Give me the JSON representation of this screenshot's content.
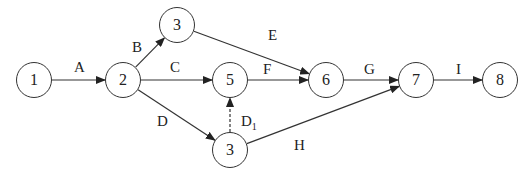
{
  "diagram": {
    "type": "activity-on-arrow network",
    "nodes": [
      {
        "id": "n1",
        "label": "1",
        "x": 34,
        "y": 80
      },
      {
        "id": "n2",
        "label": "2",
        "x": 123,
        "y": 80
      },
      {
        "id": "n3top",
        "label": "3",
        "x": 177,
        "y": 25
      },
      {
        "id": "n5",
        "label": "5",
        "x": 230,
        "y": 80
      },
      {
        "id": "n3bot",
        "label": "3",
        "x": 230,
        "y": 150
      },
      {
        "id": "n6",
        "label": "6",
        "x": 326,
        "y": 80
      },
      {
        "id": "n7",
        "label": "7",
        "x": 416,
        "y": 80
      },
      {
        "id": "n8",
        "label": "8",
        "x": 500,
        "y": 80
      }
    ],
    "edges": [
      {
        "label": "A",
        "from": "n1",
        "to": "n2",
        "dashed": false,
        "lx": 74,
        "ly": 60
      },
      {
        "label": "B",
        "from": "n2",
        "to": "n3top",
        "dashed": false,
        "lx": 132,
        "ly": 40
      },
      {
        "label": "C",
        "from": "n2",
        "to": "n5",
        "dashed": false,
        "lx": 170,
        "ly": 60
      },
      {
        "label": "D",
        "from": "n2",
        "to": "n3bot",
        "dashed": false,
        "lx": 157,
        "ly": 114
      },
      {
        "label": "E",
        "from": "n3top",
        "to": "n6",
        "dashed": false,
        "lx": 268,
        "ly": 28
      },
      {
        "label": "F",
        "from": "n5",
        "to": "n6",
        "dashed": false,
        "lx": 263,
        "ly": 62
      },
      {
        "label": "G",
        "from": "n6",
        "to": "n7",
        "dashed": false,
        "lx": 364,
        "ly": 62
      },
      {
        "label": "H",
        "from": "n3bot",
        "to": "n7",
        "dashed": false,
        "lx": 294,
        "ly": 138
      },
      {
        "label": "I",
        "from": "n7",
        "to": "n8",
        "dashed": false,
        "lx": 456,
        "ly": 62
      },
      {
        "label": "D",
        "sub": "1",
        "from": "n3bot",
        "to": "n5",
        "dashed": true,
        "lx": 241,
        "ly": 114
      }
    ]
  }
}
